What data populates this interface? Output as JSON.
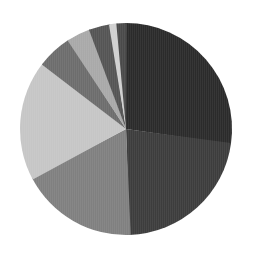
{
  "chart_data": {
    "type": "pie",
    "title": "",
    "subtitle": "",
    "xlabel": "",
    "ylabel": "",
    "legend": "none",
    "grid": false,
    "start_angle_deg": 0,
    "direction": "clockwise",
    "center": {
      "cx": 126,
      "cy": 129
    },
    "radius": 106,
    "categories": [
      "Slice 1",
      "Slice 2",
      "Slice 3",
      "Slice 4",
      "Slice 5",
      "Slice 6",
      "Slice 7",
      "Slice 8",
      "Slice 9"
    ],
    "values": [
      27.2,
      22.2,
      17.8,
      18.3,
      5.3,
      3.6,
      3.1,
      1.1,
      1.4
    ],
    "units": "percent",
    "angles_deg": [
      97.9,
      79.9,
      64.1,
      65.9,
      19.1,
      13.0,
      11.2,
      4.0,
      5.0
    ],
    "colors": [
      "#2b2b2b",
      "#3d3d3d",
      "#808080",
      "#c6c6c6",
      "#6d6d6d",
      "#a9a9a9",
      "#555555",
      "#d0d0d0",
      "#4a4a4a"
    ],
    "slices": [
      {
        "label": "Slice 1",
        "value": 27.2,
        "angle_deg": 97.9,
        "start_deg": 0.0,
        "end_deg": 97.9,
        "color": "#2b2b2b"
      },
      {
        "label": "Slice 2",
        "value": 22.2,
        "angle_deg": 79.9,
        "start_deg": 97.9,
        "end_deg": 177.8,
        "color": "#3d3d3d"
      },
      {
        "label": "Slice 3",
        "value": 17.8,
        "angle_deg": 64.1,
        "start_deg": 177.8,
        "end_deg": 241.9,
        "color": "#808080"
      },
      {
        "label": "Slice 4",
        "value": 18.3,
        "angle_deg": 65.9,
        "start_deg": 241.9,
        "end_deg": 307.8,
        "color": "#c6c6c6"
      },
      {
        "label": "Slice 5",
        "value": 5.3,
        "angle_deg": 19.1,
        "start_deg": 307.8,
        "end_deg": 326.9,
        "color": "#6d6d6d"
      },
      {
        "label": "Slice 6",
        "value": 3.6,
        "angle_deg": 13.0,
        "start_deg": 326.9,
        "end_deg": 339.9,
        "color": "#a9a9a9"
      },
      {
        "label": "Slice 7",
        "value": 3.1,
        "angle_deg": 11.2,
        "start_deg": 339.9,
        "end_deg": 351.1,
        "color": "#555555"
      },
      {
        "label": "Slice 8",
        "value": 1.1,
        "angle_deg": 4.0,
        "start_deg": 351.1,
        "end_deg": 355.1,
        "color": "#d0d0d0"
      },
      {
        "label": "Slice 9",
        "value": 1.4,
        "angle_deg": 5.0,
        "start_deg": 355.1,
        "end_deg": 360.0,
        "color": "#4a4a4a"
      }
    ],
    "background_color": "#ffffff"
  }
}
